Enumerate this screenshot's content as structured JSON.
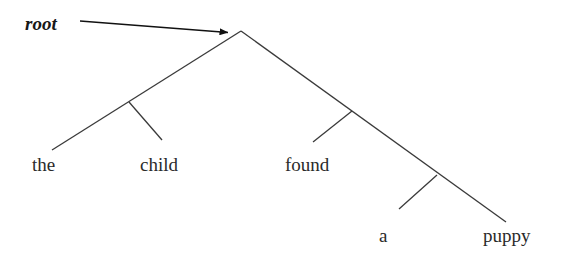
{
  "diagram": {
    "type": "syntactic-tree",
    "title": "",
    "background_color": "#ffffff",
    "line_color": "#3a3a3a",
    "text_color": "#2a2a2a",
    "annotation": {
      "label": "root",
      "style": "bold-italic",
      "x": 25,
      "y": 14,
      "arrow": {
        "name": "root-arrow",
        "from_x": 80,
        "from_y": 21,
        "to_x": 230,
        "to_y": 33
      }
    },
    "apex": {
      "x": 241,
      "y": 31
    },
    "terminals": [
      {
        "id": "the",
        "label": "the",
        "x": 32,
        "y": 155
      },
      {
        "id": "child",
        "label": "child",
        "x": 140,
        "y": 155
      },
      {
        "id": "found",
        "label": "found",
        "x": 285,
        "y": 155
      },
      {
        "id": "a",
        "label": "a",
        "x": 379,
        "y": 226
      },
      {
        "id": "puppy",
        "label": "puppy",
        "x": 483,
        "y": 226
      }
    ],
    "edges": [
      {
        "name": "apex-to-the",
        "x1": 241,
        "y1": 31,
        "x2": 52,
        "y2": 150
      },
      {
        "name": "child-branch",
        "x1": 129,
        "y1": 102,
        "x2": 162,
        "y2": 140
      },
      {
        "name": "apex-to-puppy",
        "x1": 241,
        "y1": 31,
        "x2": 506,
        "y2": 222
      },
      {
        "name": "found-branch",
        "x1": 352,
        "y1": 111,
        "x2": 313,
        "y2": 142
      },
      {
        "name": "a-branch",
        "x1": 437,
        "y1": 175,
        "x2": 399,
        "y2": 209
      }
    ]
  }
}
